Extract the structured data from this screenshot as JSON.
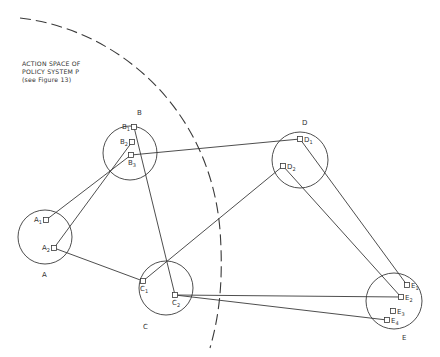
{
  "caption": {
    "line1": "ACTION SPACE OF",
    "line2": "POLICY SYSTEM P",
    "line3": "(see Figure 13)"
  },
  "colors": {
    "stroke": "#3a3a3a",
    "background": "#ffffff"
  },
  "boundary": {
    "style": "dashed-arc",
    "label": "Action space of policy system P"
  },
  "clusters": [
    {
      "id": "A",
      "label": "A",
      "cx": 45,
      "cy": 237,
      "r": 27,
      "label_x": 42,
      "label_y": 277
    },
    {
      "id": "B",
      "label": "B",
      "cx": 130,
      "cy": 153,
      "r": 27,
      "label_x": 137,
      "label_y": 115
    },
    {
      "id": "C",
      "label": "C",
      "cx": 166,
      "cy": 288,
      "r": 27,
      "label_x": 143,
      "label_y": 329
    },
    {
      "id": "D",
      "label": "D",
      "cx": 300,
      "cy": 160,
      "r": 28,
      "label_x": 302,
      "label_y": 125
    },
    {
      "id": "E",
      "label": "E",
      "cx": 394,
      "cy": 301,
      "r": 28,
      "label_x": 402,
      "label_y": 340
    }
  ],
  "nodes": [
    {
      "id": "A1",
      "base": "A",
      "sub": "1",
      "x": 46,
      "y": 220,
      "label_side": "left"
    },
    {
      "id": "A2",
      "base": "A",
      "sub": "2",
      "x": 54,
      "y": 248,
      "label_side": "left"
    },
    {
      "id": "B1",
      "base": "B",
      "sub": "1",
      "x": 134,
      "y": 127,
      "label_side": "left"
    },
    {
      "id": "B2",
      "base": "B",
      "sub": "2",
      "x": 132,
      "y": 142,
      "label_side": "left"
    },
    {
      "id": "B3",
      "base": "B",
      "sub": "3",
      "x": 131,
      "y": 155,
      "label_side": "below"
    },
    {
      "id": "C1",
      "base": "C",
      "sub": "1",
      "x": 143,
      "y": 281,
      "label_side": "below"
    },
    {
      "id": "C2",
      "base": "C",
      "sub": "2",
      "x": 175,
      "y": 295,
      "label_side": "below"
    },
    {
      "id": "D1",
      "base": "D",
      "sub": "1",
      "x": 300,
      "y": 139,
      "label_side": "right"
    },
    {
      "id": "D2",
      "base": "D",
      "sub": "2",
      "x": 283,
      "y": 166,
      "label_side": "right"
    },
    {
      "id": "E1",
      "base": "E",
      "sub": "1",
      "x": 407,
      "y": 285,
      "label_side": "right"
    },
    {
      "id": "E2",
      "base": "E",
      "sub": "2",
      "x": 401,
      "y": 297,
      "label_side": "right"
    },
    {
      "id": "E3",
      "base": "E",
      "sub": "3",
      "x": 393,
      "y": 311,
      "label_side": "right"
    },
    {
      "id": "E4",
      "base": "E",
      "sub": "4",
      "x": 387,
      "y": 320,
      "label_side": "right"
    }
  ],
  "links": [
    {
      "from": "A1",
      "to": "B3"
    },
    {
      "from": "A2",
      "to": "B2"
    },
    {
      "from": "A2",
      "to": "C1"
    },
    {
      "from": "B1",
      "to": "C2"
    },
    {
      "from": "B3",
      "to": "D1"
    },
    {
      "from": "C1",
      "to": "D2"
    },
    {
      "from": "D1",
      "to": "E1"
    },
    {
      "from": "D2",
      "to": "E2"
    },
    {
      "from": "C2",
      "to": "E2"
    },
    {
      "from": "C2",
      "to": "E4"
    }
  ]
}
